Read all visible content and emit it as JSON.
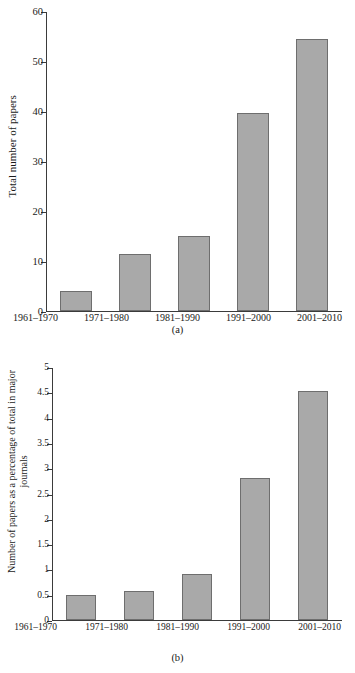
{
  "chart_data": [
    {
      "type": "bar",
      "id": "a",
      "caption": "(a)",
      "title": "",
      "xlabel": "",
      "ylabel": "Total number of papers",
      "categories": [
        "1961–1970",
        "1971–1980",
        "1981–1990",
        "1991–2000",
        "2001–2010"
      ],
      "values": [
        4,
        11.5,
        15,
        39.8,
        54.5
      ],
      "ylim": [
        0,
        60
      ],
      "yticks": [
        0,
        10,
        20,
        30,
        40,
        50,
        60
      ],
      "ytick_labels": [
        "0",
        "10",
        "20",
        "30",
        "40",
        "50",
        "60"
      ],
      "grid": false,
      "legend": "none",
      "bar_color": "#a9a9a9",
      "bar_edge_color": "#6e6e6e"
    },
    {
      "type": "bar",
      "id": "b",
      "caption": "(b)",
      "title": "",
      "xlabel": "",
      "ylabel": "Number of papers as a percentage of total in major journals",
      "categories": [
        "1961–1970",
        "1971–1980",
        "1981–1990",
        "1991–2000",
        "2001–2010"
      ],
      "values": [
        0.5,
        0.57,
        0.92,
        2.81,
        4.54
      ],
      "ylim": [
        0,
        5
      ],
      "yticks": [
        0,
        0.5,
        1,
        1.5,
        2,
        2.5,
        3,
        3.5,
        4,
        4.5,
        5
      ],
      "ytick_labels": [
        "0",
        "0.5",
        "1",
        "1.5",
        "2",
        "2.5",
        "3",
        "3.5",
        "4",
        "4.5",
        "5"
      ],
      "grid": false,
      "legend": "none",
      "bar_color": "#a9a9a9",
      "bar_edge_color": "#6e6e6e"
    }
  ]
}
